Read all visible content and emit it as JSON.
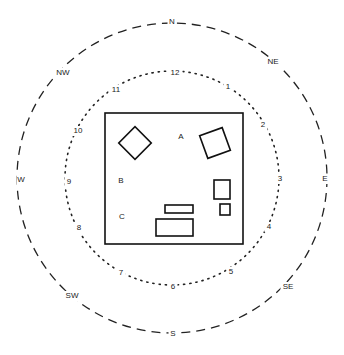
{
  "diagram": {
    "center": [
      172,
      178
    ],
    "outer_ring": {
      "style": "dashed",
      "radius": 155,
      "labels": [
        {
          "text": "N",
          "x": 172,
          "y": 22
        },
        {
          "text": "NE",
          "x": 273,
          "y": 62
        },
        {
          "text": "E",
          "x": 325,
          "y": 179
        },
        {
          "text": "SE",
          "x": 288,
          "y": 287
        },
        {
          "text": "S",
          "x": 173,
          "y": 334
        },
        {
          "text": "SW",
          "x": 72,
          "y": 296
        },
        {
          "text": "W",
          "x": 21,
          "y": 180
        },
        {
          "text": "NW",
          "x": 63,
          "y": 73
        }
      ]
    },
    "inner_ring": {
      "style": "dotted",
      "radius": 107,
      "labels": [
        {
          "text": "12",
          "x": 175,
          "y": 73
        },
        {
          "text": "1",
          "x": 228,
          "y": 87
        },
        {
          "text": "2",
          "x": 263,
          "y": 125
        },
        {
          "text": "3",
          "x": 280,
          "y": 179
        },
        {
          "text": "4",
          "x": 269,
          "y": 227
        },
        {
          "text": "5",
          "x": 231,
          "y": 272
        },
        {
          "text": "6",
          "x": 173,
          "y": 287
        },
        {
          "text": "7",
          "x": 121,
          "y": 273
        },
        {
          "text": "8",
          "x": 79,
          "y": 228
        },
        {
          "text": "9",
          "x": 69,
          "y": 182
        },
        {
          "text": "10",
          "x": 78,
          "y": 131
        },
        {
          "text": "11",
          "x": 116,
          "y": 90
        }
      ]
    },
    "box": {
      "x": 105,
      "y": 113,
      "width": 138,
      "height": 131
    },
    "zone_labels": [
      {
        "text": "A",
        "x": 181,
        "y": 137
      },
      {
        "text": "B",
        "x": 121,
        "y": 181
      },
      {
        "text": "C",
        "x": 122,
        "y": 217
      }
    ],
    "objects": [
      {
        "name": "diamond",
        "cx": 135,
        "cy": 143,
        "size": 23,
        "rotate": 45
      },
      {
        "name": "tilted-square",
        "cx": 215,
        "cy": 143,
        "size": 24,
        "rotate": -20
      },
      {
        "name": "tall-rect",
        "x": 214,
        "y": 180,
        "width": 16,
        "height": 19
      },
      {
        "name": "small-square",
        "x": 220,
        "y": 204,
        "width": 10,
        "height": 11
      },
      {
        "name": "thin-rect",
        "x": 165,
        "y": 205,
        "width": 28,
        "height": 8
      },
      {
        "name": "wide-rect",
        "x": 156,
        "y": 219,
        "width": 37,
        "height": 17
      }
    ],
    "line_color": "#111111"
  }
}
